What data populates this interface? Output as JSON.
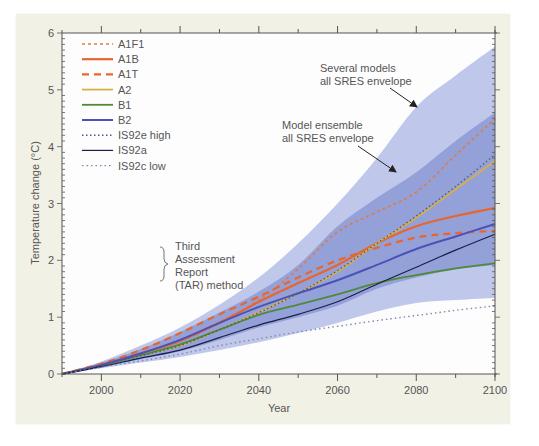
{
  "chart_data": {
    "type": "line",
    "title": "",
    "xlabel": "Year",
    "ylabel": "Temperature change (°C)",
    "xlim": [
      1990,
      2100
    ],
    "ylim": [
      0,
      6
    ],
    "x_ticks": [
      2000,
      2020,
      2040,
      2060,
      2080,
      2100
    ],
    "y_ticks": [
      0,
      1,
      2,
      3,
      4,
      5,
      6
    ],
    "grid": false,
    "legend_position": "upper-left",
    "x": [
      1990,
      2000,
      2010,
      2020,
      2030,
      2040,
      2050,
      2060,
      2070,
      2080,
      2090,
      2100
    ],
    "series": [
      {
        "name": "A1F1",
        "style": "dotted",
        "color": "#e07a45",
        "values": [
          0,
          0.16,
          0.36,
          0.6,
          0.92,
          1.3,
          1.85,
          2.5,
          2.85,
          3.2,
          3.85,
          4.49
        ]
      },
      {
        "name": "A1B",
        "style": "solid",
        "color": "#e8652e",
        "values": [
          0,
          0.16,
          0.36,
          0.58,
          0.9,
          1.27,
          1.6,
          1.92,
          2.3,
          2.6,
          2.78,
          2.92
        ]
      },
      {
        "name": "A1T",
        "style": "dashed",
        "color": "#e8652e",
        "values": [
          0,
          0.18,
          0.42,
          0.72,
          1.05,
          1.36,
          1.7,
          2.0,
          2.22,
          2.4,
          2.48,
          2.52
        ]
      },
      {
        "name": "A2",
        "style": "solid",
        "color": "#d9b040",
        "values": [
          0,
          0.15,
          0.33,
          0.5,
          0.78,
          1.09,
          1.42,
          1.8,
          2.3,
          2.75,
          3.25,
          3.75
        ]
      },
      {
        "name": "B1",
        "style": "solid",
        "color": "#4f8a3a",
        "values": [
          0,
          0.15,
          0.33,
          0.52,
          0.78,
          1.04,
          1.22,
          1.4,
          1.6,
          1.74,
          1.86,
          1.95
        ]
      },
      {
        "name": "B2",
        "style": "solid",
        "color": "#4a52b8",
        "values": [
          0,
          0.16,
          0.36,
          0.6,
          0.9,
          1.18,
          1.42,
          1.65,
          1.92,
          2.2,
          2.42,
          2.64
        ]
      },
      {
        "name": "IS92e high",
        "style": "dotted",
        "color": "#505a80",
        "values": [
          0,
          0.15,
          0.32,
          0.5,
          0.78,
          1.08,
          1.42,
          1.82,
          2.3,
          2.78,
          3.3,
          3.86
        ]
      },
      {
        "name": "IS92a",
        "style": "solid",
        "color": "#1a1e4a",
        "values": [
          0,
          0.13,
          0.28,
          0.42,
          0.64,
          0.86,
          1.05,
          1.27,
          1.58,
          1.88,
          2.18,
          2.46
        ]
      },
      {
        "name": "IS92c low",
        "style": "dotted",
        "color": "#8088b0",
        "values": [
          0,
          0.12,
          0.23,
          0.35,
          0.5,
          0.62,
          0.74,
          0.84,
          0.94,
          1.03,
          1.12,
          1.2
        ]
      }
    ],
    "envelopes": [
      {
        "name": "Several models all SRES envelope",
        "color": "#a9b6e4",
        "upper": [
          0,
          0.22,
          0.5,
          0.82,
          1.22,
          1.7,
          2.3,
          3.0,
          3.8,
          4.7,
          5.25,
          5.76
        ],
        "lower": [
          0,
          0.1,
          0.2,
          0.3,
          0.42,
          0.56,
          0.72,
          0.9,
          1.1,
          1.25,
          1.3,
          1.34
        ]
      },
      {
        "name": "Model ensemble all SRES envelope",
        "color": "#8190d0",
        "upper": [
          0,
          0.2,
          0.44,
          0.74,
          1.08,
          1.45,
          1.92,
          2.6,
          3.1,
          3.55,
          4.1,
          4.6
        ],
        "lower": [
          0,
          0.12,
          0.26,
          0.4,
          0.6,
          0.82,
          1.0,
          1.2,
          1.5,
          1.7,
          1.84,
          1.92
        ]
      }
    ],
    "annotations": [
      {
        "text": [
          "Several models",
          "all SRES envelope"
        ]
      },
      {
        "text": [
          "Model ensemble",
          "all SRES envelope"
        ]
      },
      {
        "text": [
          "Third",
          "Assessment",
          "Report",
          "(TAR) method"
        ],
        "brace_group": [
          "IS92e high",
          "IS92a",
          "IS92c low"
        ]
      }
    ]
  },
  "labels": {
    "xlabel": "Year",
    "ylabel": "Temperature change (°C)",
    "x_ticks": [
      "2000",
      "2020",
      "2040",
      "2060",
      "2080",
      "2100"
    ],
    "y_ticks": [
      "0",
      "1",
      "2",
      "3",
      "4",
      "5",
      "6"
    ],
    "legend": [
      "A1F1",
      "A1B",
      "A1T",
      "A2",
      "B1",
      "B2",
      "IS92e high",
      "IS92a",
      "IS92c low"
    ],
    "tar_note": [
      "Third",
      "Assessment",
      "Report",
      "(TAR) method"
    ],
    "outer_annot": [
      "Several models",
      "all SRES envelope"
    ],
    "inner_annot": [
      "Model ensemble",
      "all SRES envelope"
    ]
  }
}
